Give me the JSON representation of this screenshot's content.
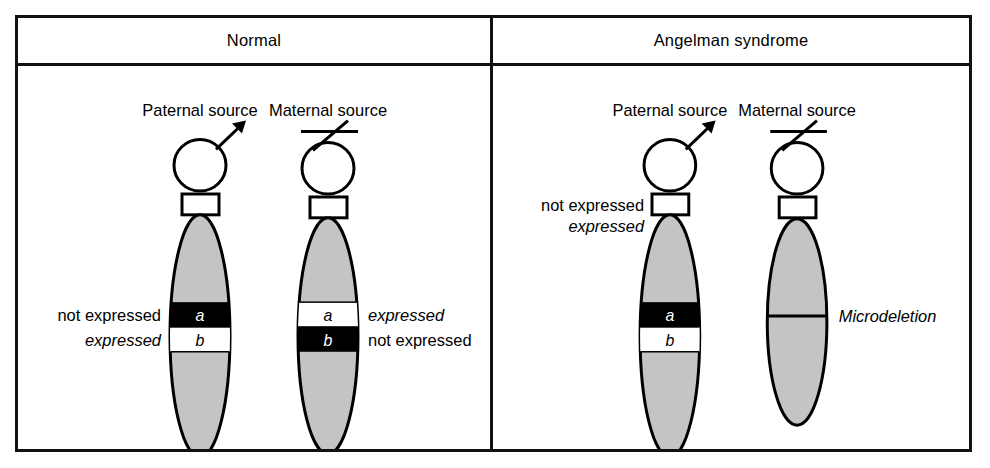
{
  "figure": {
    "title_row": {
      "normal": "Normal",
      "angelman": "Angelman syndrome"
    },
    "colors": {
      "chromosome_fill": "#c4c4c4",
      "chromosome_stroke": "#000000",
      "band_dark": "#000000",
      "band_light": "#ffffff",
      "frame": "#111111",
      "background": "#ffffff"
    },
    "panels": [
      {
        "name": "normal",
        "title": "Normal",
        "chromosomes": [
          {
            "name": "paternal",
            "source_label": "Paternal source",
            "sex_symbol": "male-arrow-icon",
            "bands": [
              {
                "id": "a",
                "letter": "a",
                "fill": "dark",
                "label": "not expressed",
                "label_side": "left",
                "label_italic": false
              },
              {
                "id": "b",
                "letter": "b",
                "fill": "light",
                "label": "expressed",
                "label_side": "left",
                "label_italic": true
              }
            ]
          },
          {
            "name": "maternal",
            "source_label": "Maternal source",
            "sex_symbol": "female-cross-icon",
            "bands": [
              {
                "id": "a",
                "letter": "a",
                "fill": "light",
                "label": "expressed",
                "label_side": "right",
                "label_italic": true
              },
              {
                "id": "b",
                "letter": "b",
                "fill": "dark",
                "label": "not expressed",
                "label_side": "right",
                "label_italic": false
              }
            ]
          }
        ]
      },
      {
        "name": "angelman",
        "title": "Angelman syndrome",
        "chromosomes": [
          {
            "name": "paternal",
            "source_label": "Paternal source",
            "sex_symbol": "male-arrow-icon",
            "centromere_labels": [
              {
                "text": "not expressed",
                "italic": false
              },
              {
                "text": "expressed",
                "italic": true
              }
            ],
            "bands": [
              {
                "id": "a",
                "letter": "a",
                "fill": "dark"
              },
              {
                "id": "b",
                "letter": "b",
                "fill": "light"
              }
            ]
          },
          {
            "name": "maternal",
            "source_label": "Maternal source",
            "sex_symbol": "female-cross-icon",
            "deletion_label": "Microdeletion",
            "bands": []
          }
        ]
      }
    ]
  }
}
